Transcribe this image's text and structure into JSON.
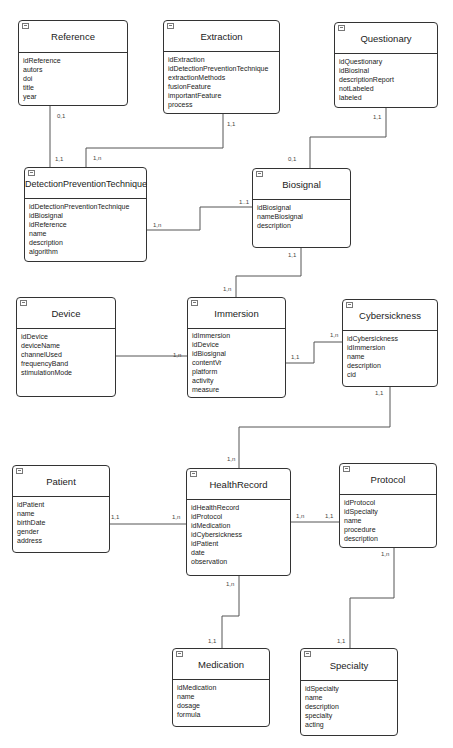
{
  "entities": {
    "reference": {
      "title": "Reference",
      "attributes": [
        "idReference",
        "autors",
        "doi",
        "title",
        "year"
      ]
    },
    "extraction": {
      "title": "Extraction",
      "attributes": [
        "idExtraction",
        "idDetectionPreventionTechnique",
        "extractionMethods",
        "fusionFeature",
        "importantFeature",
        "process"
      ]
    },
    "questionary": {
      "title": "Questionary",
      "attributes": [
        "idQuestionary",
        "idBiosinal",
        "descriptionReport",
        "notLabeled",
        "labeled"
      ]
    },
    "detection": {
      "title": "DetectionPreventionTechnique",
      "attributes": [
        "idDetectionPreventionTechnique",
        "idBiosignal",
        "idReference",
        "name",
        "description",
        "algorithm"
      ]
    },
    "biosignal": {
      "title": "Biosignal",
      "attributes": [
        "idBiosignal",
        "nameBiosignal",
        "description"
      ]
    },
    "device": {
      "title": "Device",
      "attributes": [
        "idDevice",
        "deviceName",
        "channelUsed",
        "frequencyBand",
        "stimulationMode"
      ]
    },
    "immersion": {
      "title": "Immersion",
      "attributes": [
        "idImmersion",
        "idDevice",
        "idBiosignal",
        "contentVr",
        "platform",
        "activity",
        "measure"
      ]
    },
    "cybersickness": {
      "title": "Cybersickness",
      "attributes": [
        "idCybersickness",
        "idImmersion",
        "name",
        "description",
        "cid"
      ]
    },
    "patient": {
      "title": "Patient",
      "attributes": [
        "idPatient",
        "name",
        "birthDate",
        "gender",
        "address"
      ]
    },
    "healthrecord": {
      "title": "HealthRecord",
      "attributes": [
        "idHealthRecord",
        "idProtocol",
        "idMedication",
        "idCybersickness",
        "idPatient",
        "date",
        "observation"
      ]
    },
    "protocol": {
      "title": "Protocol",
      "attributes": [
        "idProtocol",
        "idSpecialty",
        "name",
        "procedure",
        "description"
      ]
    },
    "medication": {
      "title": "Medication",
      "attributes": [
        "idMedication",
        "name",
        "dosage",
        "formula"
      ]
    },
    "specialty": {
      "title": "Specialty",
      "attributes": [
        "idSpecialty",
        "name",
        "description",
        "specialty",
        "acting"
      ]
    }
  },
  "relationships": [
    {
      "from": "reference",
      "to": "detection",
      "from_card": "0,1",
      "to_card": "1,1"
    },
    {
      "from": "extraction",
      "to": "detection",
      "from_card": "1,1",
      "to_card": "1,n"
    },
    {
      "from": "questionary",
      "to": "biosignal",
      "from_card": "1,1",
      "to_card": "0,1"
    },
    {
      "from": "detection",
      "to": "biosignal",
      "from_card": "1,n",
      "to_card": "1..1"
    },
    {
      "from": "biosignal",
      "to": "immersion",
      "from_card": "1,1",
      "to_card": "1,n"
    },
    {
      "from": "device",
      "to": "immersion",
      "from_card": "1,1",
      "to_card": "1,n"
    },
    {
      "from": "immersion",
      "to": "cybersickness",
      "from_card": "1,1",
      "to_card": "1,n"
    },
    {
      "from": "cybersickness",
      "to": "healthrecord",
      "from_card": "1,1",
      "to_card": "1,n"
    },
    {
      "from": "patient",
      "to": "healthrecord",
      "from_card": "1,1",
      "to_card": "1,n"
    },
    {
      "from": "healthrecord",
      "to": "protocol",
      "from_card": "1,n",
      "to_card": "1,1"
    },
    {
      "from": "healthrecord",
      "to": "medication",
      "from_card": "1,n",
      "to_card": "1,1"
    },
    {
      "from": "protocol",
      "to": "specialty",
      "from_card": "1,n",
      "to_card": "1,1"
    }
  ]
}
